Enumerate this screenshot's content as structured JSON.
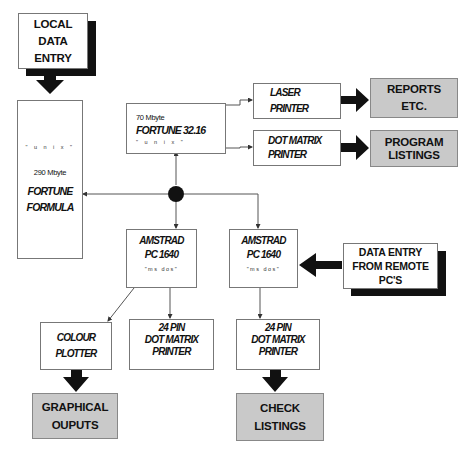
{
  "diagram": {
    "nodes": {
      "local_entry": {
        "lines": [
          "LOCAL",
          "DATA",
          "ENTRY"
        ]
      },
      "fortune_formula": {
        "os": "\" u n i x \"",
        "size": "290 Mbyte",
        "name1": "FORTUNE",
        "name2": "FORMULA"
      },
      "fortune_3216": {
        "size": "70 Mbyte",
        "name": "FORTUNE 32.16",
        "os": "\" u n i x \""
      },
      "laser_printer": {
        "line1": "LASER",
        "line2": "PRINTER"
      },
      "dot_matrix_printer": {
        "line1": "DOT MATRIX",
        "line2": "PRINTER"
      },
      "reports": {
        "line1": "REPORTS",
        "line2": "ETC."
      },
      "program_listings": {
        "line1": "PROGRAM",
        "line2": "LISTINGS"
      },
      "amstrad_1": {
        "line1": "AMSTRAD",
        "line2": "PC 1640",
        "os": "\"ms dos\""
      },
      "amstrad_2": {
        "line1": "AMSTRAD",
        "line2": "PC 1640",
        "os": "\"ms dos\""
      },
      "remote_entry": {
        "line1": "DATA ENTRY",
        "line2": "FROM REMOTE",
        "line3": "PC'S"
      },
      "colour_plotter": {
        "line1": "COLOUR",
        "line2": "PLOTTER"
      },
      "pin24_1": {
        "line1": "24 PIN",
        "line2": "DOT MATRIX",
        "line3": "PRINTER"
      },
      "pin24_2": {
        "line1": "24 PIN",
        "line2": "DOT MATRIX",
        "line3": "PRINTER"
      },
      "graphical_outputs": {
        "line1": "GRAPHICAL",
        "line2": "OUPUTS"
      },
      "check_listings": {
        "line1": "CHECK",
        "line2": "LISTINGS"
      }
    },
    "colors": {
      "output_fill": "#c9c9c9",
      "arrow": "#111111",
      "line": "#555555"
    }
  }
}
